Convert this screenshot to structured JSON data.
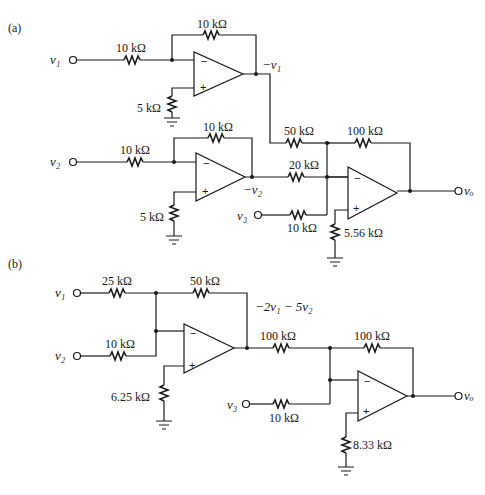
{
  "figure": {
    "part_a": {
      "label": "(a)",
      "inputs": {
        "v1": "v₁",
        "v2": "v₂",
        "v3": "v₃"
      },
      "output": "vₒ",
      "node_labels": {
        "neg_v1": "−v₁",
        "neg_v2": "−v₂"
      },
      "resistors": {
        "r_in1": "10 kΩ",
        "r_f1": "10 kΩ",
        "r_p1": "5 kΩ",
        "r_in2": "10 kΩ",
        "r_f2": "10 kΩ",
        "r_p2": "5 kΩ",
        "r_sum1": "50 kΩ",
        "r_sum2": "20 kΩ",
        "r_sum3": "10 kΩ",
        "r_f3": "100 kΩ",
        "r_p3": "5.56 kΩ"
      },
      "opamp_signs": {
        "minus": "−",
        "plus": "+"
      }
    },
    "part_b": {
      "label": "(b)",
      "inputs": {
        "v1": "v₁",
        "v2": "v₂",
        "v3": "v₃"
      },
      "output": "vₒ",
      "node_labels": {
        "mid": "−2v₁ − 5v₂"
      },
      "resistors": {
        "r_in1": "25 kΩ",
        "r_in2": "10 kΩ",
        "r_f1": "50 kΩ",
        "r_p1": "6.25 kΩ",
        "r_link": "100 kΩ",
        "r_f2": "100 kΩ",
        "r_in3": "10 kΩ",
        "r_p2": "8.33 kΩ"
      },
      "opamp_signs": {
        "minus": "−",
        "plus": "+"
      }
    }
  }
}
